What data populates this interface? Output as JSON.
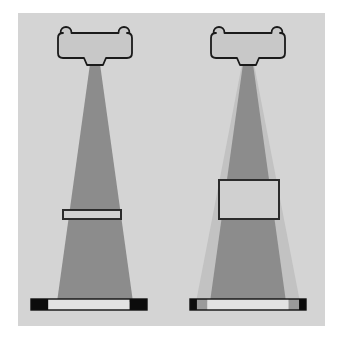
{
  "figure": {
    "background_color": "#ffffff",
    "panel_color": "#d4d4d4",
    "panel": {
      "x": 18,
      "y": 13,
      "width": 307,
      "height": 313
    }
  },
  "colors": {
    "page_background": "#ffffff",
    "panel_background": "#d4d4d4",
    "beam_primary": "#8c8c8c",
    "beam_scatter": "#c2c2c2",
    "head_fill": "#c8c8c8",
    "head_outline": "#1a1a1a",
    "object_fill": "#d0d0d0",
    "object_outline": "#2b2b2b",
    "bar_block_dark": "#0c0c0c",
    "bar_block_mid": "#9a9a9a",
    "bar_interior": "#e2e2e2",
    "bar_outline": "#111111"
  },
  "scenes": [
    {
      "id": "left",
      "name": "thin-attenuator-scene",
      "label": "a",
      "source_head": {
        "name": "radiation-source-head",
        "center_x": 95,
        "top_y": 26,
        "width": 74,
        "height": 32,
        "bump_count": 2,
        "nozzle_width": 16,
        "nozzle_height": 7
      },
      "beam": {
        "name": "primary-beam-fan",
        "apex_x": 95,
        "apex_y": 64,
        "apex_half_width": 5,
        "base_y": 302,
        "base_half_width": 38,
        "has_scatter_fan": false,
        "scatter_base_half_width": 0
      },
      "object": {
        "name": "thin-attenuator-slab",
        "present": true,
        "shape": "thin-strip",
        "x": 63,
        "y": 210,
        "width": 58,
        "height": 9
      },
      "detector_bar": {
        "name": "detector-bar",
        "x": 31,
        "y": 299,
        "width": 116,
        "height": 11,
        "segments": [
          {
            "name": "bar-end-left-dark",
            "width_pct": 15,
            "color": "#0c0c0c"
          },
          {
            "name": "bar-interior",
            "width_pct": 70,
            "color": "#e2e2e2"
          },
          {
            "name": "bar-end-right-dark",
            "width_pct": 15,
            "color": "#0c0c0c"
          }
        ]
      }
    },
    {
      "id": "right",
      "name": "thick-phantom-scatter-scene",
      "label": "b",
      "source_head": {
        "name": "radiation-source-head",
        "center_x": 248,
        "top_y": 26,
        "width": 74,
        "height": 32,
        "bump_count": 2,
        "nozzle_width": 16,
        "nozzle_height": 7
      },
      "beam": {
        "name": "primary-beam-fan",
        "apex_x": 248,
        "apex_y": 64,
        "apex_half_width": 5,
        "base_y": 302,
        "base_half_width": 38,
        "has_scatter_fan": true,
        "scatter_base_half_width": 52
      },
      "object": {
        "name": "thick-scattering-phantom",
        "present": true,
        "shape": "block",
        "x": 219,
        "y": 180,
        "width": 60,
        "height": 39
      },
      "detector_bar": {
        "name": "detector-bar",
        "x": 190,
        "y": 299,
        "width": 116,
        "height": 11,
        "segments": [
          {
            "name": "bar-end-left-dark",
            "width_pct": 6,
            "color": "#0c0c0c"
          },
          {
            "name": "bar-penumbra-left",
            "width_pct": 9,
            "color": "#9a9a9a"
          },
          {
            "name": "bar-interior",
            "width_pct": 70,
            "color": "#e2e2e2"
          },
          {
            "name": "bar-penumbra-right",
            "width_pct": 9,
            "color": "#9a9a9a"
          },
          {
            "name": "bar-end-right-dark",
            "width_pct": 6,
            "color": "#0c0c0c"
          }
        ]
      }
    }
  ]
}
